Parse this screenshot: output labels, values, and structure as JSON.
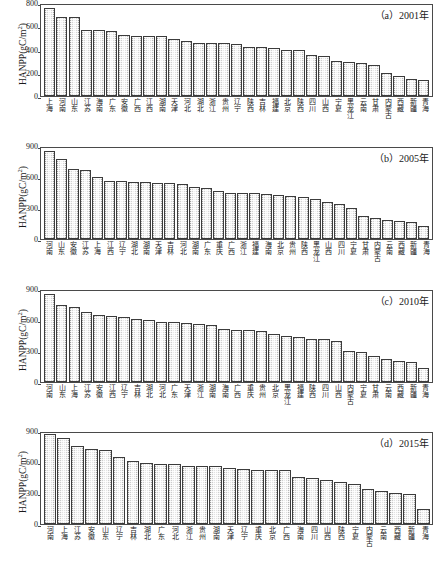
{
  "figure": {
    "y_axis_title": "HANPP(gC/m",
    "y_axis_title_sup": "2",
    "y_axis_title_end": ")"
  },
  "chart_data": [
    {
      "type": "bar",
      "panel": "(a)",
      "title": "（a）2001年",
      "xlabel": "",
      "ylabel": "HANPP(gC/m2)",
      "ylim": [
        0,
        800
      ],
      "yticks": [
        0,
        200,
        400,
        600,
        800
      ],
      "grid": false,
      "legend": "none",
      "categories": [
        "上海",
        "河南",
        "山东",
        "江苏",
        "海南",
        "广东",
        "安徽",
        "广西",
        "江西",
        "湖南",
        "天津",
        "河北",
        "湖北",
        "浙江",
        "贵州",
        "辽宁",
        "陕西",
        "吉林",
        "福建",
        "北京",
        "陕西",
        "四川",
        "山西",
        "宁夏",
        "黑龙江",
        "云南",
        "甘肃",
        "内蒙古",
        "西藏",
        "新疆",
        "青海"
      ],
      "values": [
        770,
        695,
        695,
        580,
        578,
        572,
        538,
        530,
        525,
        525,
        505,
        480,
        470,
        470,
        465,
        455,
        435,
        430,
        420,
        408,
        405,
        362,
        350,
        312,
        297,
        290,
        272,
        198,
        180,
        150,
        138
      ]
    },
    {
      "type": "bar",
      "panel": "(b)",
      "title": "（b）2005年",
      "xlabel": "",
      "ylabel": "HANPP(gC/m2)",
      "ylim": [
        0,
        900
      ],
      "yticks": [
        0,
        300,
        600,
        900
      ],
      "grid": false,
      "legend": "none",
      "categories": [
        "河南",
        "山东",
        "安徽",
        "江苏",
        "上海",
        "江西",
        "辽宁",
        "湖北",
        "湖南",
        "天津",
        "吉林",
        "河北",
        "湖南",
        "广东",
        "重庆",
        "广西",
        "浙江",
        "福建",
        "海南",
        "北京",
        "贵州",
        "陕西",
        "黑龙江",
        "山西",
        "四川",
        "宁夏",
        "甘肃",
        "内蒙古",
        "云南",
        "西藏",
        "新疆",
        "青海"
      ],
      "values": [
        870,
        790,
        690,
        685,
        610,
        570,
        568,
        565,
        558,
        550,
        548,
        545,
        510,
        500,
        468,
        455,
        452,
        448,
        440,
        430,
        425,
        418,
        398,
        360,
        340,
        300,
        225,
        205,
        190,
        180,
        165,
        130
      ]
    },
    {
      "type": "bar",
      "panel": "(c)",
      "title": "（c）2010年",
      "xlabel": "",
      "ylabel": "HANPP(gC/m2)",
      "ylim": [
        0,
        900
      ],
      "yticks": [
        0,
        300,
        600,
        900
      ],
      "grid": false,
      "legend": "none",
      "categories": [
        "河南",
        "山东",
        "上海",
        "江苏",
        "安徽",
        "江西",
        "辽宁",
        "吉林",
        "湖北",
        "河北",
        "广东",
        "天津",
        "浙江",
        "湖南",
        "海南",
        "广西",
        "重庆",
        "贵州",
        "北京",
        "黑龙江",
        "福建",
        "陕西",
        "四川",
        "山西",
        "内蒙古",
        "宁夏",
        "甘肃",
        "云南",
        "西藏",
        "新疆",
        "青海"
      ],
      "values": [
        865,
        760,
        740,
        685,
        655,
        650,
        640,
        620,
        605,
        592,
        585,
        580,
        572,
        560,
        520,
        510,
        505,
        500,
        470,
        455,
        440,
        425,
        420,
        405,
        300,
        290,
        250,
        222,
        205,
        195,
        130
      ]
    },
    {
      "type": "bar",
      "panel": "(d)",
      "title": "（d）2015年",
      "xlabel": "",
      "ylabel": "HANPP(gC/m2)",
      "ylim": [
        0,
        900
      ],
      "yticks": [
        0,
        300,
        600,
        900
      ],
      "grid": false,
      "legend": "none",
      "categories": [
        "河南",
        "上海",
        "江苏",
        "安徽",
        "山东",
        "辽宁",
        "吉林",
        "湖北",
        "广东",
        "河北",
        "浙江",
        "贵州",
        "湖南",
        "天津",
        "辽宁",
        "重庆",
        "北京",
        "广西",
        "海南",
        "四川",
        "山西",
        "陕西",
        "宁夏",
        "内蒙古",
        "云南",
        "西藏",
        "新疆",
        "青海"
      ],
      "values": [
        890,
        855,
        775,
        740,
        735,
        665,
        625,
        605,
        600,
        600,
        580,
        578,
        575,
        555,
        548,
        540,
        538,
        535,
        470,
        455,
        440,
        420,
        395,
        350,
        330,
        305,
        300,
        150
      ]
    }
  ]
}
